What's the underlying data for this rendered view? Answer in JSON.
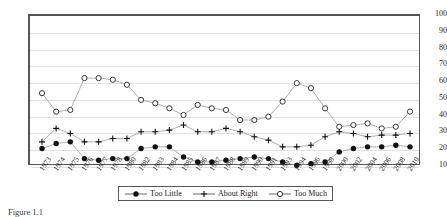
{
  "chart_data": {
    "type": "line",
    "title": "",
    "xlabel": "",
    "ylabel": "",
    "ylim": [
      10,
      100
    ],
    "ytick_step": 10,
    "yticks": [
      100,
      90,
      80,
      70,
      60,
      50,
      40,
      30,
      20,
      10
    ],
    "grid": true,
    "legend_position": "bottom",
    "categories": [
      "1973",
      "1974",
      "1975",
      "1976",
      "1977",
      "1978",
      "1980",
      "1982",
      "1983",
      "1984",
      "1985",
      "1986",
      "1987",
      "1988",
      "1989",
      "1990",
      "1991",
      "1993",
      "1994",
      "1996",
      "1998",
      "2000",
      "2002",
      "2004",
      "2006",
      "2008",
      "2010"
    ],
    "series": [
      {
        "name": "Too Little",
        "marker": "filled-circle",
        "values": [
          21,
          24,
          25,
          15,
          14,
          15,
          15,
          21,
          22,
          22,
          16,
          13,
          13,
          14,
          15,
          16,
          15,
          13,
          11,
          12,
          13,
          19,
          21,
          22,
          22,
          23,
          22
        ]
      },
      {
        "name": "About Right",
        "marker": "plus",
        "values": [
          25,
          33,
          30,
          25,
          25,
          27,
          27,
          31,
          31,
          32,
          35,
          31,
          31,
          33,
          31,
          28,
          26,
          22,
          22,
          23,
          28,
          31,
          30,
          28,
          29,
          29,
          30
        ]
      },
      {
        "name": "Too Much",
        "marker": "open-circle",
        "values": [
          54,
          43,
          44,
          63,
          63,
          62,
          59,
          50,
          48,
          45,
          41,
          47,
          45,
          44,
          38,
          38,
          40,
          49,
          60,
          57,
          45,
          34,
          35,
          36,
          33,
          34,
          43
        ]
      }
    ]
  },
  "legend": {
    "items": [
      {
        "label": "Too Little",
        "marker": "filled-circle"
      },
      {
        "label": "About Right",
        "marker": "plus"
      },
      {
        "label": "Too Much",
        "marker": "open-circle"
      }
    ]
  },
  "caption": {
    "text": "Figure 1.1"
  }
}
